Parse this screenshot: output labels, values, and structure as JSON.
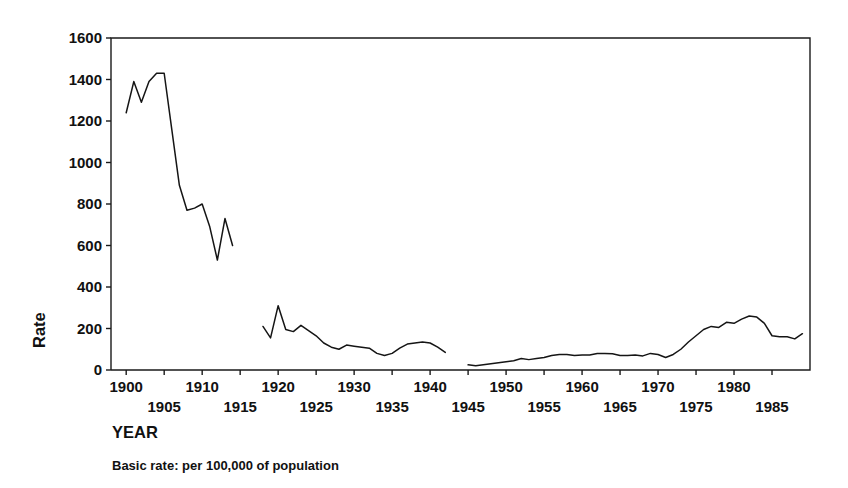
{
  "figure": {
    "background_color": "#ffffff",
    "line_color": "#151515",
    "axis_color": "#1a1a1a"
  },
  "labels": {
    "y_axis_title": "Rate",
    "x_axis_title": "YEAR",
    "caption": "Basic rate: per 100,000 of population"
  },
  "chart_data": {
    "type": "line",
    "title": "",
    "subtitle": "",
    "xlabel": "YEAR",
    "ylabel": "Rate",
    "caption": "Basic rate: per 100,000 of population",
    "xlim": [
      1898,
      1990
    ],
    "ylim": [
      0,
      1600
    ],
    "grid": false,
    "legend": "none",
    "yticks": [
      0,
      200,
      400,
      600,
      800,
      1000,
      1200,
      1400,
      1600
    ],
    "ytick_labels": [
      "0",
      "200",
      "400",
      "600",
      "800",
      "1000",
      "1200",
      "1400",
      "1600"
    ],
    "xticks_upper": [
      1900,
      1910,
      1920,
      1930,
      1940,
      1950,
      1960,
      1970,
      1980
    ],
    "xtick_labels_upper": [
      "1900",
      "1910",
      "1920",
      "1930",
      "1940",
      "1950",
      "1960",
      "1970",
      "1980"
    ],
    "xticks_lower": [
      1905,
      1915,
      1925,
      1935,
      1945,
      1955,
      1965,
      1975,
      1985
    ],
    "xtick_labels_lower": [
      "1905",
      "1915",
      "1925",
      "1935",
      "1945",
      "1955",
      "1965",
      "1975",
      "1985"
    ],
    "series": [
      {
        "name": "Rate per 100,000",
        "note": "Three disconnected segments separated by data gaps (1915-1917 and 1943-1944)",
        "segments": [
          {
            "label": "1900-1914",
            "x": [
              1900,
              1901,
              1902,
              1903,
              1904,
              1905,
              1906,
              1907,
              1908,
              1909,
              1910,
              1911,
              1912,
              1913,
              1914
            ],
            "y": [
              1240,
              1390,
              1290,
              1390,
              1430,
              1430,
              1160,
              890,
              770,
              780,
              800,
              690,
              530,
              730,
              600
            ]
          },
          {
            "label": "1918-1942",
            "x": [
              1918,
              1919,
              1920,
              1921,
              1922,
              1923,
              1924,
              1925,
              1926,
              1927,
              1928,
              1929,
              1930,
              1931,
              1932,
              1933,
              1934,
              1935,
              1936,
              1937,
              1938,
              1939,
              1940,
              1941,
              1942
            ],
            "y": [
              210,
              155,
              310,
              195,
              185,
              215,
              190,
              165,
              130,
              110,
              100,
              120,
              115,
              110,
              105,
              80,
              70,
              80,
              105,
              125,
              130,
              135,
              130,
              110,
              85
            ]
          },
          {
            "label": "1945-1989",
            "x": [
              1945,
              1946,
              1947,
              1948,
              1949,
              1950,
              1951,
              1952,
              1953,
              1954,
              1955,
              1956,
              1957,
              1958,
              1959,
              1960,
              1961,
              1962,
              1963,
              1964,
              1965,
              1966,
              1967,
              1968,
              1969,
              1970,
              1971,
              1972,
              1973,
              1974,
              1975,
              1976,
              1977,
              1978,
              1979,
              1980,
              1981,
              1982,
              1983,
              1984,
              1985,
              1986,
              1987,
              1988,
              1989
            ],
            "y": [
              25,
              20,
              25,
              30,
              35,
              40,
              45,
              55,
              50,
              55,
              60,
              70,
              75,
              75,
              70,
              72,
              72,
              80,
              80,
              78,
              70,
              70,
              72,
              68,
              80,
              75,
              60,
              75,
              100,
              135,
              165,
              195,
              210,
              205,
              230,
              225,
              245,
              260,
              255,
              225,
              165,
              160,
              160,
              150,
              175
            ]
          }
        ]
      }
    ]
  }
}
